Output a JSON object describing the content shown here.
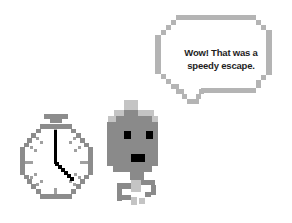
{
  "speech_bubble": {
    "text_line1": "Wow! That was a",
    "text_line2": "speedy escape.",
    "border_color": "#b4b4b4",
    "fill_color": "#ffffff"
  },
  "stopwatch": {
    "icon": "stopwatch-icon",
    "time_shown": "4:00",
    "body_color": "#8c8c8c",
    "tick_color": "#a0a0a0",
    "hand_color": "#000000",
    "face_color": "#f4f4f4"
  },
  "character": {
    "icon": "round-creature-icon",
    "body_color": "#8a8a8a",
    "highlight_color": "#c4c4c4",
    "eye_color": "#000000"
  }
}
